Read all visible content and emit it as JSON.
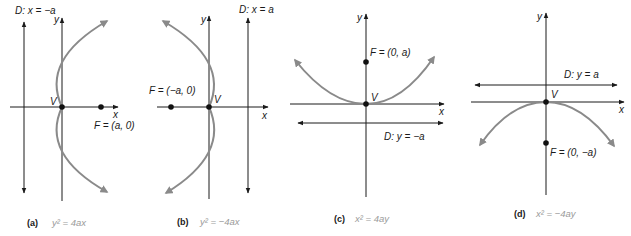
{
  "figure": {
    "panels": [
      {
        "id": "a",
        "caption_letter": "(a)",
        "equation": "y² = 4ax",
        "directrix_label": "D: x = −a",
        "focus_label": "F = (a, 0)",
        "vertex_label": "V",
        "x_axis_label": "x",
        "y_axis_label": "y",
        "opens": "right"
      },
      {
        "id": "b",
        "caption_letter": "(b)",
        "equation": "y² = −4ax",
        "directrix_label": "D: x = a",
        "focus_label": "F = (−a, 0)",
        "vertex_label": "V",
        "x_axis_label": "x",
        "y_axis_label": "y",
        "opens": "left"
      },
      {
        "id": "c",
        "caption_letter": "(c)",
        "equation": "x² = 4ay",
        "directrix_label": "D: y = −a",
        "focus_label": "F = (0, a)",
        "vertex_label": "V",
        "x_axis_label": "x",
        "y_axis_label": "y",
        "opens": "up"
      },
      {
        "id": "d",
        "caption_letter": "(d)",
        "equation": "x² = −4ay",
        "directrix_label": "D: y = a",
        "focus_label": "F = (0, −a)",
        "vertex_label": "V",
        "x_axis_label": "x",
        "y_axis_label": "y",
        "opens": "down"
      }
    ],
    "colors": {
      "axes": "#1a1a1a",
      "curve": "#8a8a8a",
      "points": "#111111",
      "equation_text": "#9a9a9a"
    }
  }
}
